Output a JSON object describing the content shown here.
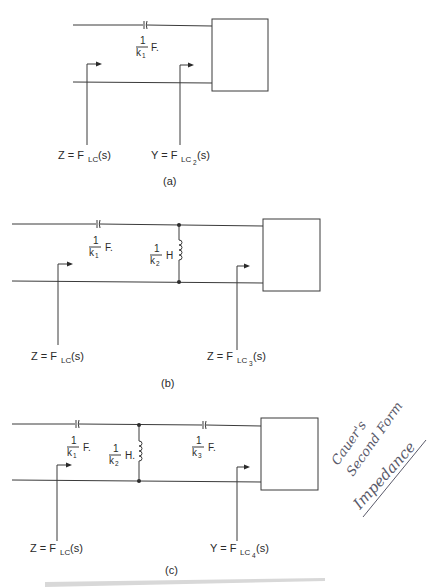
{
  "figure": {
    "panels": [
      {
        "id": "a",
        "caption": "(a)",
        "components": [
          {
            "type": "capacitor",
            "value_num": "1",
            "value_den": "k",
            "value_den_sub": "1",
            "unit": "F."
          }
        ],
        "left_label": {
          "lhs": "Z = F",
          "sub": "LC",
          "sub2": "",
          "rhs": "(s)"
        },
        "right_label": {
          "lhs": "Y = F",
          "sub": "LC",
          "sub2": "2",
          "rhs": "(s)"
        }
      },
      {
        "id": "b",
        "caption": "(b)",
        "components": [
          {
            "type": "capacitor",
            "value_num": "1",
            "value_den": "k",
            "value_den_sub": "1",
            "unit": "F."
          },
          {
            "type": "inductor",
            "value_num": "1",
            "value_den": "k",
            "value_den_sub": "2",
            "unit": "H"
          }
        ],
        "left_label": {
          "lhs": "Z = F",
          "sub": "LC",
          "sub2": "",
          "rhs": "(s)"
        },
        "right_label": {
          "lhs": "Z = F",
          "sub": "LC",
          "sub2": "3",
          "rhs": "(s)"
        }
      },
      {
        "id": "c",
        "caption": "(c)",
        "components": [
          {
            "type": "capacitor",
            "value_num": "1",
            "value_den": "k",
            "value_den_sub": "1",
            "unit": "F."
          },
          {
            "type": "inductor",
            "value_num": "1",
            "value_den": "k",
            "value_den_sub": "2",
            "unit": "H."
          },
          {
            "type": "capacitor",
            "value_num": "1",
            "value_den": "k",
            "value_den_sub": "3",
            "unit": "F."
          }
        ],
        "left_label": {
          "lhs": "Z = F",
          "sub": "LC",
          "sub2": "",
          "rhs": "(s)"
        },
        "right_label": {
          "lhs": "Y = F",
          "sub": "LC",
          "sub2": "4",
          "rhs": "(s)"
        }
      }
    ],
    "handwritten_note": {
      "lines": [
        "Cauer's",
        "Second Form",
        "Impedance"
      ]
    }
  }
}
